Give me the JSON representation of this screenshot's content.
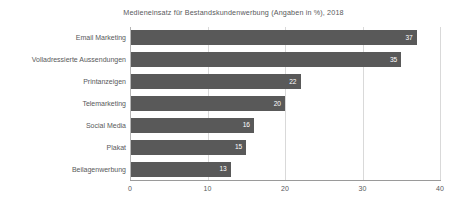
{
  "chart_data": {
    "type": "bar",
    "orientation": "horizontal",
    "title": "Medieneinsatz für Bestandskundenwerbung (Angaben in %), 2018",
    "xlabel": "",
    "ylabel": "",
    "categories": [
      "Email Marketing",
      "Volladressierte Aussendungen",
      "Printanzeigen",
      "Telemarketing",
      "Social Media",
      "Plakat",
      "Beilagenwerbung"
    ],
    "values": [
      37,
      35,
      22,
      20,
      16,
      15,
      13
    ],
    "value_labels": [
      "37",
      "35",
      "22",
      "20",
      "16",
      "15",
      "13"
    ],
    "xlim": [
      0,
      40
    ],
    "xticks": [
      0,
      10,
      20,
      30,
      40
    ],
    "xtick_labels": [
      "0",
      "10",
      "20",
      "30",
      "40"
    ],
    "grid": "vertical",
    "legend": "none",
    "bar_color": "#595959",
    "value_label_color": "#ffffff",
    "gridline_color": "#d9d9d9",
    "text_color": "#58595b",
    "background_color": "#ffffff"
  }
}
